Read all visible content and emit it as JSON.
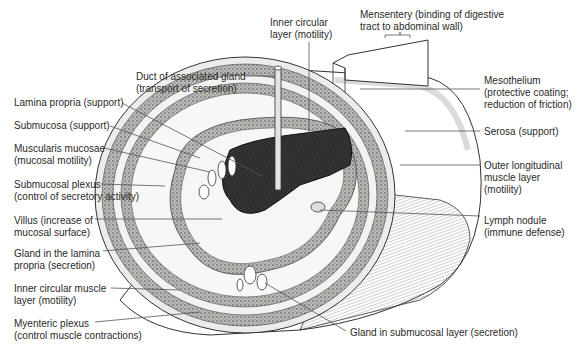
{
  "diagram": {
    "labels_left": [
      {
        "id": "lamina-propria",
        "lines": [
          "Lamina propria (support)"
        ],
        "x": 14,
        "y": 97
      },
      {
        "id": "submucosa",
        "lines": [
          "Submucosa (support)"
        ],
        "x": 14,
        "y": 120
      },
      {
        "id": "muscularis-mucosae",
        "lines": [
          "Muscularis mucosae",
          "(mucosal motility)"
        ],
        "x": 14,
        "y": 143
      },
      {
        "id": "submucosal-plexus",
        "lines": [
          "Submucosal plexus",
          "(control of secretory activity)"
        ],
        "x": 14,
        "y": 179
      },
      {
        "id": "villus",
        "lines": [
          "Villus (increase of",
          "mucosal surface)"
        ],
        "x": 14,
        "y": 215
      },
      {
        "id": "gland-lamina-propria",
        "lines": [
          "Gland in the lamina",
          "propria (secretion)"
        ],
        "x": 14,
        "y": 248
      },
      {
        "id": "inner-circular-muscle",
        "lines": [
          "Inner circular muscle",
          "layer (motility)"
        ],
        "x": 14,
        "y": 283
      },
      {
        "id": "myenteric-plexus",
        "lines": [
          "Myenteric plexus",
          "(control muscle contractions)"
        ],
        "x": 14,
        "y": 318
      }
    ],
    "labels_top": [
      {
        "id": "duct-associated-gland",
        "lines": [
          "Duct of associated gland",
          "(transport of secretion)"
        ],
        "x": 136,
        "y": 71
      },
      {
        "id": "inner-circular-layer",
        "lines": [
          "Inner circular",
          "layer (motility)"
        ],
        "x": 270,
        "y": 17
      },
      {
        "id": "mesentery",
        "lines": [
          "Mensentery (binding of digestive",
          "tract to abdominal wall)"
        ],
        "x": 360,
        "y": 9
      }
    ],
    "labels_right": [
      {
        "id": "mesothelium",
        "lines": [
          "Mesothelium",
          "(protective coating;",
          "reduction of friction)"
        ],
        "x": 484,
        "y": 75
      },
      {
        "id": "serosa",
        "lines": [
          "Serosa (support)"
        ],
        "x": 484,
        "y": 126
      },
      {
        "id": "outer-longitudinal-muscle",
        "lines": [
          "Outer longitudinal",
          "muscle layer",
          "(motility)"
        ],
        "x": 484,
        "y": 160
      },
      {
        "id": "lymph-nodule",
        "lines": [
          "Lymph nodule",
          "(immune defense)"
        ],
        "x": 484,
        "y": 215
      }
    ],
    "labels_bottom": [
      {
        "id": "gland-submucosal-layer",
        "lines": [
          "Gland in submucosal layer (secretion)"
        ],
        "x": 350,
        "y": 327
      }
    ],
    "colors": {
      "ink": "#2a2a2a",
      "leader": "#555555",
      "tissue_light": "#f4f4f2",
      "tissue_dark": "#8a8a88",
      "lumen": "#1a1a1a"
    }
  }
}
